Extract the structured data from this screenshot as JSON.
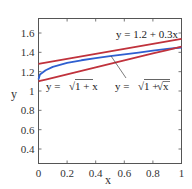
{
  "chart_data": {
    "type": "line",
    "title": "",
    "xlabel": "x",
    "ylabel": "y",
    "xlim": [
      0,
      1
    ],
    "ylim": [
      0.25,
      1.75
    ],
    "grid": false,
    "legend": "none (inline annotations)",
    "x_ticks": [
      "0",
      "0.2",
      "0.4",
      "0.6",
      "0.8",
      "1"
    ],
    "y_ticks": [
      "0.4",
      "0.6",
      "0.8",
      "1",
      "1.2",
      "1.4",
      "1.6"
    ],
    "x": [
      0,
      0.01,
      0.05,
      0.1,
      0.2,
      0.3,
      0.4,
      0.5,
      0.6,
      0.7,
      0.8,
      0.9,
      1.0
    ],
    "series": [
      {
        "name": "y = 1.2 + 0.3x",
        "color": "#c0323c",
        "values": [
          1.28,
          1.283,
          1.293,
          1.306,
          1.332,
          1.358,
          1.384,
          1.41,
          1.436,
          1.462,
          1.488,
          1.514,
          1.54
        ]
      },
      {
        "name": "y = sqrt(1 + sqrt(x))",
        "color": "#2f5fd0",
        "values": [
          1.12,
          1.17,
          1.215,
          1.25,
          1.29,
          1.318,
          1.34,
          1.36,
          1.38,
          1.398,
          1.417,
          1.435,
          1.45
        ]
      },
      {
        "name": "y = sqrt(1 + x)",
        "color": "#c0323c",
        "values": [
          1.1,
          1.104,
          1.118,
          1.136,
          1.172,
          1.208,
          1.244,
          1.28,
          1.316,
          1.352,
          1.388,
          1.424,
          1.46
        ]
      }
    ],
    "annotations": [
      {
        "text": "y = 1.2 + 0.3x",
        "x": 0.55,
        "y": 1.6
      },
      {
        "text": "y = √(1 + x)",
        "x": 0.05,
        "y": 1.02
      },
      {
        "text": "y = √(1 + √x)",
        "x": 0.53,
        "y": 1.02,
        "arrow_to": [
          0.5,
          1.37
        ]
      }
    ]
  },
  "labels": {
    "xlabel": "x",
    "ylabel": "y",
    "ann_line": "y = 1.2 + 0.3x",
    "ann_sqrt1x_prefix": "y = ",
    "ann_sqrt1x_body": "1 + x",
    "ann_sqrt1sqrtx_prefix": "y = ",
    "ann_sqrt1sqrtx_body": "1 + ",
    "ann_sqrt1sqrtx_inner": "x"
  }
}
